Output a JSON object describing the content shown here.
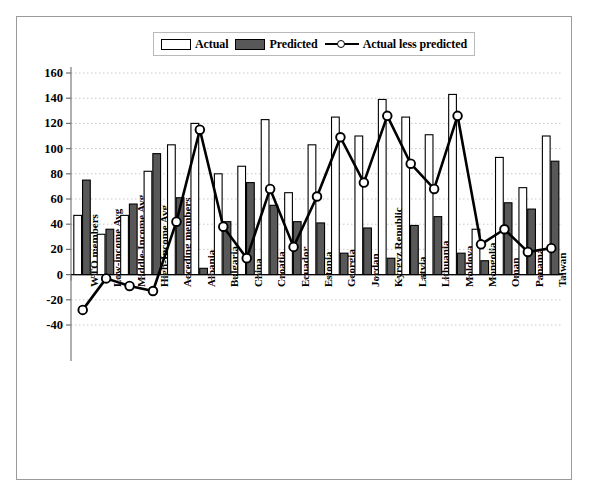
{
  "figure": {
    "frame_border_color": "#9a9a9a",
    "background": "#ffffff"
  },
  "legend": {
    "position": "top-center",
    "entries": [
      {
        "label": "Actual",
        "type": "bar",
        "fill": "#ffffff",
        "stroke": "#000000",
        "icon": "open-rect-swatch-icon"
      },
      {
        "label": "Predicted",
        "type": "bar",
        "fill": "#585858",
        "stroke": "#000000",
        "icon": "filled-rect-swatch-icon"
      },
      {
        "label": "Actual less predicted",
        "type": "line",
        "fill": "#ffffff",
        "stroke": "#000000",
        "icon": "line-marker-swatch-icon"
      }
    ]
  },
  "axes": {
    "y_label": "",
    "x_label": "",
    "y_ticks": [
      160,
      140,
      120,
      100,
      80,
      60,
      40,
      20,
      0,
      -20,
      -40
    ],
    "y_tick_labels": [
      "160",
      "140",
      "120",
      "100",
      "80",
      "60",
      "40",
      "20",
      "0",
      "-20",
      "-40"
    ],
    "ylim": [
      -40,
      160
    ],
    "grid": "horizontal-dotted"
  },
  "chart_data": {
    "type": "bar",
    "title": "",
    "subtitle": "",
    "xlabel": "",
    "ylabel": "",
    "ylim": [
      -40,
      160
    ],
    "grid": true,
    "legend_position": "top-center",
    "categories": [
      "WTO members",
      "Low-income Avg",
      "Middle-Income Avg",
      "High-Income Avg",
      "Acceding members",
      "Albania",
      "Bulgaria",
      "China",
      "Croatia",
      "Ecuador",
      "Estonia",
      "Georgia",
      "Jordan",
      "Kyrgyz Republic",
      "Latvia",
      "Lithuania",
      "Moldova",
      "Mongolia",
      "Oman",
      "Panama",
      "Taiwan"
    ],
    "series": [
      {
        "name": "Actual",
        "kind": "bar",
        "fill": "#ffffff",
        "stroke": "#000000",
        "values": [
          47,
          32,
          47,
          82,
          103,
          120,
          80,
          86,
          123,
          65,
          103,
          125,
          110,
          139,
          125,
          111,
          143,
          36,
          93,
          69,
          110
        ]
      },
      {
        "name": "Predicted",
        "kind": "bar",
        "fill": "#585858",
        "stroke": "#000000",
        "values": [
          75,
          36,
          56,
          96,
          61,
          5,
          42,
          73,
          55,
          42,
          41,
          17,
          37,
          13,
          39,
          46,
          17,
          11,
          57,
          52,
          90
        ]
      },
      {
        "name": "Actual less predicted",
        "kind": "line",
        "stroke": "#000000",
        "marker": "open-circle",
        "values": [
          -28,
          -3,
          -9,
          -13,
          42,
          115,
          38,
          13,
          68,
          22,
          62,
          109,
          73,
          126,
          88,
          68,
          126,
          24,
          36,
          18,
          21
        ]
      }
    ]
  }
}
